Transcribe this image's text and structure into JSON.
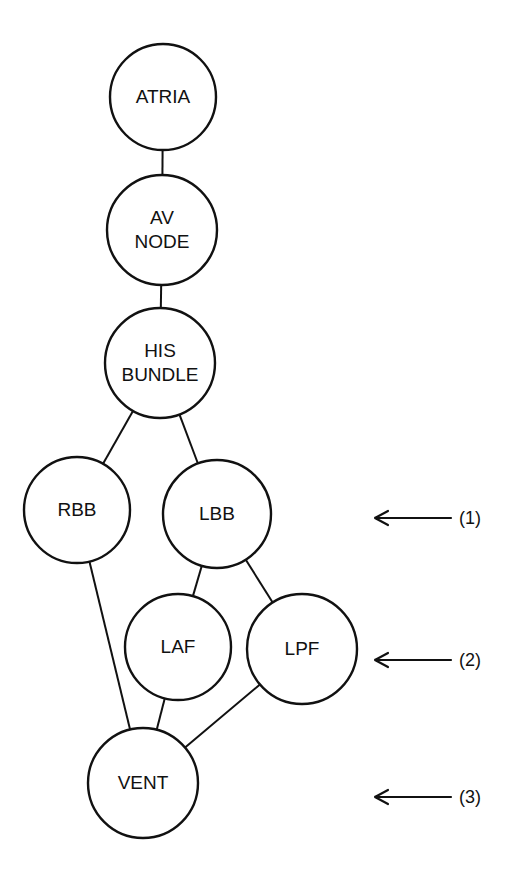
{
  "diagram": {
    "type": "conduction-tree",
    "nodes": [
      {
        "id": "atria",
        "lines": [
          "ATRIA"
        ],
        "cx": 163,
        "cy": 97,
        "r": 53
      },
      {
        "id": "avnode",
        "lines": [
          "AV",
          "NODE"
        ],
        "cx": 162,
        "cy": 230,
        "r": 55
      },
      {
        "id": "his",
        "lines": [
          "HIS",
          "BUNDLE"
        ],
        "cx": 160,
        "cy": 363,
        "r": 55
      },
      {
        "id": "rbb",
        "lines": [
          "RBB"
        ],
        "cx": 77,
        "cy": 510,
        "r": 53
      },
      {
        "id": "lbb",
        "lines": [
          "LBB"
        ],
        "cx": 217,
        "cy": 514,
        "r": 54
      },
      {
        "id": "laf",
        "lines": [
          "LAF"
        ],
        "cx": 178,
        "cy": 647,
        "r": 53
      },
      {
        "id": "lpf",
        "lines": [
          "LPF"
        ],
        "cx": 302,
        "cy": 649,
        "r": 55
      },
      {
        "id": "vent",
        "lines": [
          "VENT"
        ],
        "cx": 143,
        "cy": 783,
        "r": 55
      }
    ],
    "edges": [
      {
        "from": "atria",
        "to": "avnode"
      },
      {
        "from": "avnode",
        "to": "his"
      },
      {
        "from": "his",
        "to": "rbb"
      },
      {
        "from": "his",
        "to": "lbb"
      },
      {
        "from": "lbb",
        "to": "laf"
      },
      {
        "from": "lbb",
        "to": "lpf"
      },
      {
        "from": "rbb",
        "to": "vent"
      },
      {
        "from": "laf",
        "to": "vent"
      },
      {
        "from": "lpf",
        "to": "vent"
      }
    ],
    "level_markers": [
      {
        "label": "(1)",
        "y": 518
      },
      {
        "label": "(2)",
        "y": 660
      },
      {
        "label": "(3)",
        "y": 797
      }
    ],
    "stroke_color": "#111111",
    "background": "#ffffff"
  }
}
